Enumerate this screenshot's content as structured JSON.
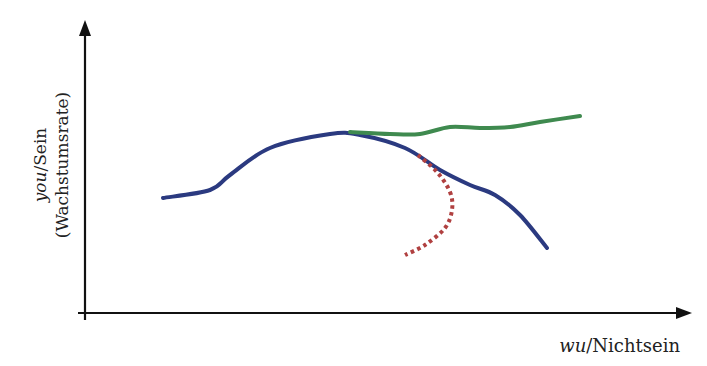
{
  "chart_data": {
    "type": "line",
    "title": "",
    "xlabel": "wu/Nichtsein",
    "ylabel": "you/Sein (Wachstumsrate)",
    "xlabel_parts": {
      "italic": "wu",
      "rest": "/Nichtsein"
    },
    "ylabel_parts": {
      "italic": "you",
      "rest": "/Sein",
      "line2": "(Wachstumsrate)"
    },
    "grid": false,
    "legend": null,
    "axis_ticks": "none",
    "series": [
      {
        "name": "main-curve",
        "color": "#2b3a80",
        "style": "solid",
        "points": [
          [
            163,
            198
          ],
          [
            210,
            190
          ],
          [
            230,
            175
          ],
          [
            270,
            148
          ],
          [
            330,
            134
          ],
          [
            360,
            135
          ],
          [
            405,
            148
          ],
          [
            440,
            170
          ],
          [
            470,
            185
          ],
          [
            495,
            195
          ],
          [
            520,
            215
          ],
          [
            547,
            248
          ]
        ]
      },
      {
        "name": "upper-branch",
        "color": "#3f8a4f",
        "style": "solid",
        "points": [
          [
            350,
            132
          ],
          [
            390,
            134
          ],
          [
            420,
            134
          ],
          [
            450,
            127
          ],
          [
            480,
            128
          ],
          [
            510,
            127
          ],
          [
            540,
            122
          ],
          [
            580,
            116
          ]
        ]
      },
      {
        "name": "lower-branch",
        "color": "#b04040",
        "style": "dotted",
        "points": [
          [
            418,
            155
          ],
          [
            437,
            172
          ],
          [
            450,
            192
          ],
          [
            452,
            210
          ],
          [
            445,
            228
          ],
          [
            425,
            245
          ],
          [
            405,
            255
          ]
        ]
      }
    ]
  },
  "axes": {
    "color": "#111111",
    "origin": [
      85,
      313
    ],
    "y_top": [
      85,
      20
    ],
    "x_right": [
      690,
      313
    ]
  }
}
